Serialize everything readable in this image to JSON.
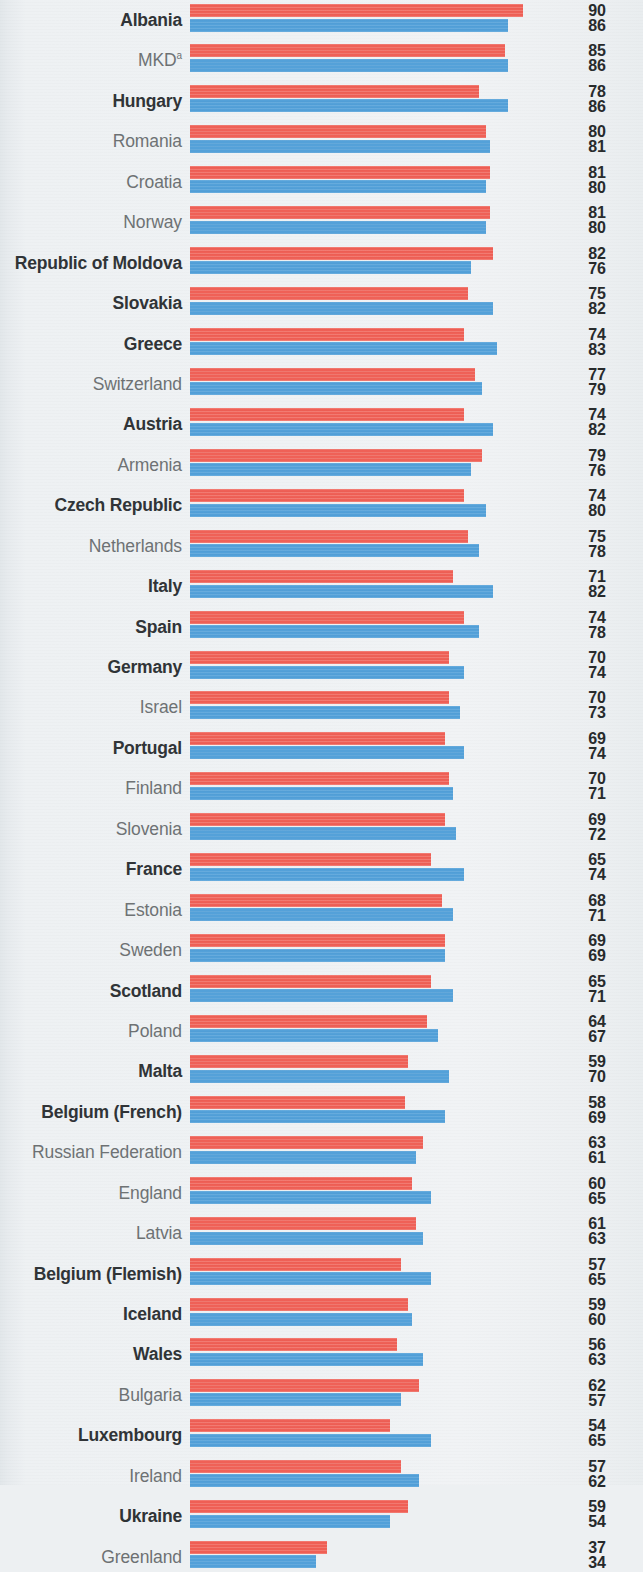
{
  "chart_data": {
    "type": "bar",
    "orientation": "horizontal",
    "title": "",
    "subtitle": "",
    "xlabel": "",
    "ylabel": "",
    "xlim": [
      0,
      90
    ],
    "grid": false,
    "legend_position": "none",
    "value_labels_position": "right",
    "colors": {
      "series_a": "#ef5f55",
      "series_b": "#52a0d9",
      "background": "#edf0f2",
      "label_regular": "#6d7173",
      "label_bold": "#2f3336",
      "value_text": "#26292b"
    },
    "series": [
      {
        "name": "series-a",
        "color": "#ef5f55",
        "values": [
          90,
          85,
          78,
          80,
          81,
          81,
          82,
          75,
          74,
          77,
          74,
          79,
          74,
          75,
          71,
          74,
          70,
          70,
          69,
          70,
          69,
          65,
          68,
          69,
          65,
          64,
          59,
          58,
          63,
          60,
          61,
          57,
          59,
          56,
          62,
          54,
          57,
          59,
          37
        ]
      },
      {
        "name": "series-b",
        "color": "#52a0d9",
        "values": [
          86,
          86,
          86,
          81,
          80,
          80,
          76,
          82,
          83,
          79,
          82,
          76,
          80,
          78,
          82,
          78,
          74,
          73,
          74,
          71,
          72,
          74,
          71,
          69,
          71,
          67,
          70,
          69,
          61,
          65,
          63,
          65,
          60,
          63,
          57,
          65,
          62,
          54,
          34
        ]
      }
    ],
    "categories": [
      {
        "label": "Albania",
        "bold": true,
        "superscript": "",
        "a": 90,
        "b": 86
      },
      {
        "label": "MKD",
        "bold": false,
        "superscript": "a",
        "a": 85,
        "b": 86
      },
      {
        "label": "Hungary",
        "bold": true,
        "superscript": "",
        "a": 78,
        "b": 86
      },
      {
        "label": "Romania",
        "bold": false,
        "superscript": "",
        "a": 80,
        "b": 81
      },
      {
        "label": "Croatia",
        "bold": false,
        "superscript": "",
        "a": 81,
        "b": 80
      },
      {
        "label": "Norway",
        "bold": false,
        "superscript": "",
        "a": 81,
        "b": 80
      },
      {
        "label": "Republic of Moldova",
        "bold": true,
        "superscript": "",
        "a": 82,
        "b": 76
      },
      {
        "label": "Slovakia",
        "bold": true,
        "superscript": "",
        "a": 75,
        "b": 82
      },
      {
        "label": "Greece",
        "bold": true,
        "superscript": "",
        "a": 74,
        "b": 83
      },
      {
        "label": "Switzerland",
        "bold": false,
        "superscript": "",
        "a": 77,
        "b": 79
      },
      {
        "label": "Austria",
        "bold": true,
        "superscript": "",
        "a": 74,
        "b": 82
      },
      {
        "label": "Armenia",
        "bold": false,
        "superscript": "",
        "a": 79,
        "b": 76
      },
      {
        "label": "Czech Republic",
        "bold": true,
        "superscript": "",
        "a": 74,
        "b": 80
      },
      {
        "label": "Netherlands",
        "bold": false,
        "superscript": "",
        "a": 75,
        "b": 78
      },
      {
        "label": "Italy",
        "bold": true,
        "superscript": "",
        "a": 71,
        "b": 82
      },
      {
        "label": "Spain",
        "bold": true,
        "superscript": "",
        "a": 74,
        "b": 78
      },
      {
        "label": "Germany",
        "bold": true,
        "superscript": "",
        "a": 70,
        "b": 74
      },
      {
        "label": "Israel",
        "bold": false,
        "superscript": "",
        "a": 70,
        "b": 73
      },
      {
        "label": "Portugal",
        "bold": true,
        "superscript": "",
        "a": 69,
        "b": 74
      },
      {
        "label": "Finland",
        "bold": false,
        "superscript": "",
        "a": 70,
        "b": 71
      },
      {
        "label": "Slovenia",
        "bold": false,
        "superscript": "",
        "a": 69,
        "b": 72
      },
      {
        "label": "France",
        "bold": true,
        "superscript": "",
        "a": 65,
        "b": 74
      },
      {
        "label": "Estonia",
        "bold": false,
        "superscript": "",
        "a": 68,
        "b": 71
      },
      {
        "label": "Sweden",
        "bold": false,
        "superscript": "",
        "a": 69,
        "b": 69
      },
      {
        "label": "Scotland",
        "bold": true,
        "superscript": "",
        "a": 65,
        "b": 71
      },
      {
        "label": "Poland",
        "bold": false,
        "superscript": "",
        "a": 64,
        "b": 67
      },
      {
        "label": "Malta",
        "bold": true,
        "superscript": "",
        "a": 59,
        "b": 70
      },
      {
        "label": "Belgium (French)",
        "bold": true,
        "superscript": "",
        "a": 58,
        "b": 69
      },
      {
        "label": "Russian Federation",
        "bold": false,
        "superscript": "",
        "a": 63,
        "b": 61
      },
      {
        "label": "England",
        "bold": false,
        "superscript": "",
        "a": 60,
        "b": 65
      },
      {
        "label": "Latvia",
        "bold": false,
        "superscript": "",
        "a": 61,
        "b": 63
      },
      {
        "label": "Belgium (Flemish)",
        "bold": true,
        "superscript": "",
        "a": 57,
        "b": 65
      },
      {
        "label": "Iceland",
        "bold": true,
        "superscript": "",
        "a": 59,
        "b": 60
      },
      {
        "label": "Wales",
        "bold": true,
        "superscript": "",
        "a": 56,
        "b": 63
      },
      {
        "label": "Bulgaria",
        "bold": false,
        "superscript": "",
        "a": 62,
        "b": 57
      },
      {
        "label": "Luxembourg",
        "bold": true,
        "superscript": "",
        "a": 54,
        "b": 65
      },
      {
        "label": "Ireland",
        "bold": false,
        "superscript": "",
        "a": 57,
        "b": 62
      },
      {
        "label": "Ukraine",
        "bold": true,
        "superscript": "",
        "a": 59,
        "b": 54
      },
      {
        "label": "Greenland",
        "bold": false,
        "superscript": "",
        "a": 37,
        "b": 34
      }
    ]
  },
  "layout": {
    "bar_origin_x": 190,
    "px_per_unit": 3.7,
    "row_height": 40.45,
    "bar_height": 13
  }
}
